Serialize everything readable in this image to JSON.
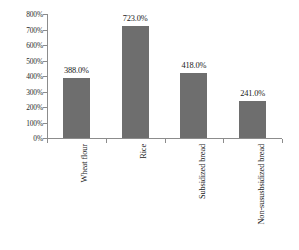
{
  "chart_data": {
    "type": "bar",
    "title": "",
    "subtitle": "",
    "xlabel": "",
    "ylabel": "",
    "categories": [
      "Wheat flour",
      "Rice",
      "Subsidized bread",
      "Non-sususbsidized bread"
    ],
    "values": [
      388.0,
      723.0,
      418.0,
      241.0
    ],
    "value_labels": [
      "388.0%",
      "723.0%",
      "418.0%",
      "241.0%"
    ],
    "ylim": [
      0,
      800
    ],
    "ytick_values": [
      0,
      100,
      200,
      300,
      400,
      500,
      600,
      700,
      800
    ],
    "ytick_labels": [
      "0%",
      "100%",
      "200%",
      "300%",
      "400%",
      "500%",
      "600%",
      "700%",
      "800%"
    ],
    "grid": false,
    "legend": null,
    "legend_position": "none",
    "series": [
      {
        "name": "",
        "values": [
          388.0,
          723.0,
          418.0,
          241.0
        ],
        "color": "#6e6e6e"
      }
    ],
    "colors": {
      "bar": "#6e6e6e",
      "axis": "#8c8c8c",
      "text": "#1a1a1a",
      "background": "#ffffff"
    }
  }
}
